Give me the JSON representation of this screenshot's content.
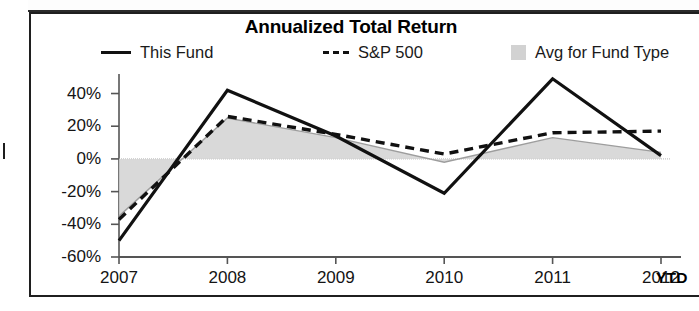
{
  "chart_data": {
    "type": "line",
    "title": "Annualized Total Return",
    "xlabel": "",
    "ylabel": "",
    "x": [
      "2007",
      "2008",
      "2009",
      "2010",
      "2011",
      "2012"
    ],
    "categories": [
      "2007",
      "2008",
      "2009",
      "2010",
      "2011",
      "2012"
    ],
    "x_axis_note": "YTD",
    "ytick_labels": [
      "40%",
      "20%",
      "0%",
      "-20%",
      "-40%",
      "-60%"
    ],
    "ytick_values": [
      40,
      20,
      0,
      -20,
      -40,
      -60
    ],
    "ylim": [
      -60,
      55
    ],
    "grid": false,
    "legend_position": "top",
    "zero_line": true,
    "series": [
      {
        "name": "This Fund",
        "style": "solid",
        "color": "#111111",
        "values": [
          -50,
          42,
          14,
          -21,
          49,
          2
        ]
      },
      {
        "name": "S&P 500",
        "style": "dashed",
        "color": "#111111",
        "values": [
          -37,
          26,
          15,
          3,
          16,
          17
        ]
      },
      {
        "name": "Avg for Fund Type",
        "style": "area",
        "color": "#d2d2d2",
        "values": [
          -35,
          25,
          13,
          -2,
          13,
          4
        ]
      }
    ]
  },
  "chart": {
    "title": "Annualized Total Return",
    "ytd_label": "YTD",
    "legend": [
      {
        "label": "This Fund",
        "swatch": "solid-line-swatch"
      },
      {
        "label": "S&P 500",
        "swatch": "dashed-line-swatch"
      },
      {
        "label": "Avg for Fund Type",
        "swatch": "area-fill-swatch"
      }
    ]
  }
}
